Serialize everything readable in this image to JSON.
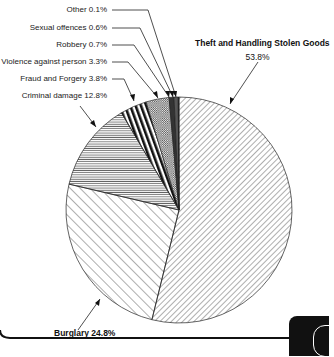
{
  "chart_data": {
    "type": "pie",
    "title": "",
    "categories": [
      "Theft and Handling Stolen Goods",
      "Burglary",
      "Criminal damage",
      "Fraud and Forgery",
      "Violence against person",
      "Robbery",
      "Sexual offences",
      "Other"
    ],
    "values": [
      53.8,
      24.8,
      12.8,
      3.8,
      3.3,
      0.7,
      0.6,
      0.1
    ],
    "unit": "%",
    "start_angle_deg": 0,
    "direction": "clockwise from 12 o'clock",
    "legend": "none (direct labels with leader arrows)",
    "patterns": [
      "fine diagonal hatch (/)",
      "wide diagonal hatch (\\)",
      "horizontal hatch",
      "vertical bars",
      "cross-hatch",
      "dark fill",
      "dark fill",
      "solid"
    ]
  },
  "labels": {
    "other": "Other 0.1%",
    "sexual": "Sexual offences 0.6%",
    "robbery": "Robbery 0.7%",
    "violence": "Violence against person 3.3%",
    "fraud": "Fraud and Forgery 3.8%",
    "criminal": "Criminal damage 12.8%",
    "theft_name": "Theft and Handling Stolen Goods",
    "theft_pct": "53.8%",
    "burglary": "Burglary 24.8%"
  },
  "colors": {
    "ink": "#222222",
    "background": "#ffffff",
    "tab": "#111111"
  }
}
